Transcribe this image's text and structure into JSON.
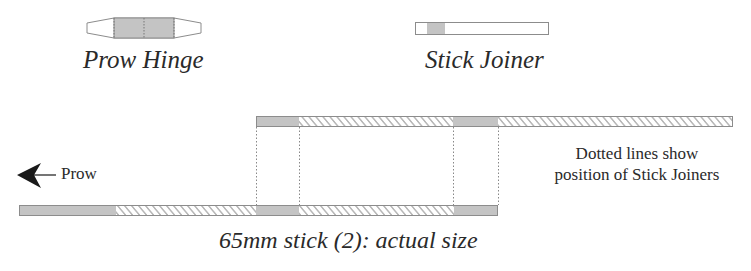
{
  "legend": {
    "prow_hinge": {
      "label": "Prow Hinge"
    },
    "stick_joiner": {
      "label": "Stick Joiner"
    }
  },
  "direction": {
    "label": "Prow",
    "icon": "arrow-left-icon"
  },
  "note": {
    "line1": "Dotted lines show",
    "line2": "position of Stick Joiners"
  },
  "caption": "65mm stick (2): actual size",
  "colors": {
    "stroke": "#8c8c8c",
    "fill_gray": "#c4c4c4",
    "hatch": "#9a9a9a",
    "text": "#2a2a2a"
  }
}
